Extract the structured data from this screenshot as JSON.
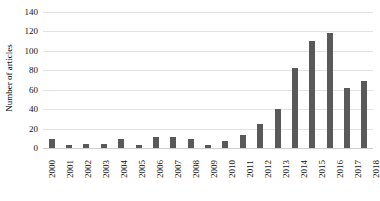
{
  "chart_data": {
    "type": "bar",
    "title": "",
    "xlabel": "",
    "ylabel": "Number of articles",
    "categories": [
      "2000",
      "2001",
      "2002",
      "2003",
      "2004",
      "2005",
      "2006",
      "2007",
      "2008",
      "2009",
      "2010",
      "2011",
      "2012",
      "2013",
      "2014",
      "2015",
      "2016",
      "2017",
      "2018"
    ],
    "values": [
      9,
      3,
      4,
      4,
      9,
      3,
      11,
      11,
      9,
      3,
      7,
      13,
      25,
      40,
      82,
      110,
      118,
      62,
      69
    ],
    "series": [
      {
        "name": "Number of articles",
        "values": [
          9,
          3,
          4,
          4,
          9,
          3,
          11,
          11,
          9,
          3,
          7,
          13,
          25,
          40,
          82,
          110,
          118,
          62,
          69
        ]
      }
    ],
    "ylim": [
      0,
      140
    ],
    "ytick_values": [
      140,
      120,
      100,
      80,
      60,
      40,
      20,
      0
    ],
    "ytick_labels": [
      "140",
      "120",
      "100",
      "80",
      "60",
      "40",
      "20",
      "0"
    ],
    "grid": true,
    "legend": false,
    "legend_position": "none",
    "bar_color": "#595959",
    "gridline_color": "#e3e3e3",
    "background_color": "#ffffff"
  }
}
